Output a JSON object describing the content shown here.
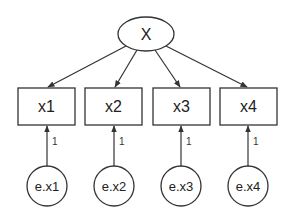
{
  "diagram": {
    "type": "structural-equation-model",
    "latent": {
      "id": "X",
      "label": "X",
      "cx": 146,
      "cy": 34,
      "rx": 28,
      "ry": 17
    },
    "observed": [
      {
        "id": "x1",
        "label": "x1",
        "x": 18,
        "y": 88,
        "w": 57,
        "h": 37
      },
      {
        "id": "x2",
        "label": "x2",
        "x": 85,
        "y": 88,
        "w": 57,
        "h": 37
      },
      {
        "id": "x3",
        "label": "x3",
        "x": 153,
        "y": 88,
        "w": 57,
        "h": 37
      },
      {
        "id": "x4",
        "label": "x4",
        "x": 220,
        "y": 88,
        "w": 57,
        "h": 37
      }
    ],
    "errors": [
      {
        "id": "e.x1",
        "label": "e.x1",
        "cx": 47,
        "cy": 186,
        "r": 20
      },
      {
        "id": "e.x2",
        "label": "e.x2",
        "cx": 114,
        "cy": 186,
        "r": 20
      },
      {
        "id": "e.x3",
        "label": "e.x3",
        "cx": 181,
        "cy": 186,
        "r": 20
      },
      {
        "id": "e.x4",
        "label": "e.x4",
        "cx": 248,
        "cy": 186,
        "r": 20
      }
    ],
    "error_path_coefficients": [
      "1",
      "1",
      "1",
      "1"
    ],
    "edges": [
      {
        "from": "X",
        "to": "x1"
      },
      {
        "from": "X",
        "to": "x2"
      },
      {
        "from": "X",
        "to": "x3"
      },
      {
        "from": "X",
        "to": "x4"
      },
      {
        "from": "e.x1",
        "to": "x1",
        "label": "1"
      },
      {
        "from": "e.x2",
        "to": "x2",
        "label": "1"
      },
      {
        "from": "e.x3",
        "to": "x3",
        "label": "1"
      },
      {
        "from": "e.x4",
        "to": "x4",
        "label": "1"
      }
    ],
    "colors": {
      "stroke": "#333333",
      "text": "#222222",
      "background": "#ffffff"
    }
  }
}
